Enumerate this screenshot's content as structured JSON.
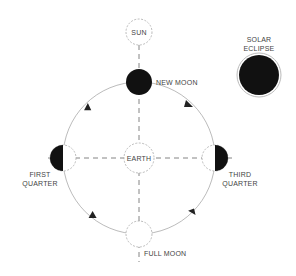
{
  "diagram": {
    "labels": {
      "sun": "SUN",
      "earth": "EARTH",
      "new_moon": "NEW MOON",
      "first_quarter_1": "FIRST",
      "first_quarter_2": "QUARTER",
      "third_quarter_1": "THIRD",
      "third_quarter_2": "QUARTER",
      "full_moon": "FULL MOON",
      "solar_eclipse_1": "SOLAR",
      "solar_eclipse_2": "ECLIPSE"
    },
    "colors": {
      "background": "#ffffff",
      "dark_fill": "#111111",
      "line": "#999999",
      "text": "#444444"
    },
    "orbit_direction": "counter-clockwise"
  }
}
